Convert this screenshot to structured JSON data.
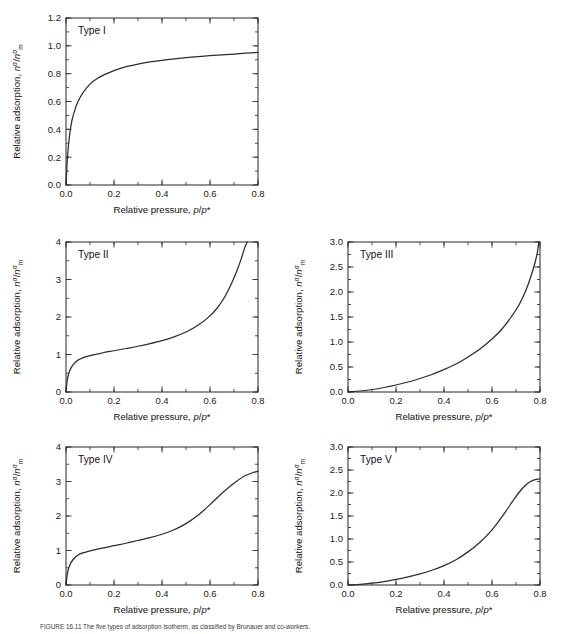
{
  "figure": {
    "caption": "FIGURE 16.11  The five types of adsorption isotherm, as classified by Brunauer and co-workers.",
    "axis": {
      "xlabel_prefix": "Relative pressure, ",
      "xlabel_var": "p/p*",
      "ylabel_prefix": "Relative adsorption, ",
      "ylabel_var": "nσ/nσm"
    }
  },
  "chart_data": [
    {
      "type": "line",
      "title": "Type I",
      "xlabel": "Relative pressure, p/p*",
      "ylabel": "Relative adsorption, nσ/nσm",
      "xlim": [
        0.0,
        0.8
      ],
      "ylim": [
        0.0,
        1.2
      ],
      "xticks": [
        0.0,
        0.2,
        0.4,
        0.6,
        0.8
      ],
      "xticklabels": [
        "0.0",
        "0.2",
        "0.4",
        "0.6",
        "0.8"
      ],
      "yticks": [
        0.0,
        0.2,
        0.4,
        0.6,
        0.8,
        1.0,
        1.2
      ],
      "yticklabels": [
        "0.0",
        "0.2",
        "0.4",
        "0.6",
        "0.8",
        "1.0",
        "1.2"
      ],
      "xminor_step": 0.1,
      "yminor_step": 0.1,
      "grid": false,
      "legend": "none",
      "x": [
        0.0,
        0.005,
        0.01,
        0.02,
        0.03,
        0.05,
        0.07,
        0.1,
        0.13,
        0.16,
        0.2,
        0.25,
        0.3,
        0.35,
        0.4,
        0.45,
        0.5,
        0.55,
        0.6,
        0.65,
        0.7,
        0.75,
        0.8
      ],
      "y": [
        0.0,
        0.17,
        0.28,
        0.42,
        0.5,
        0.6,
        0.66,
        0.725,
        0.765,
        0.793,
        0.822,
        0.85,
        0.869,
        0.884,
        0.896,
        0.906,
        0.915,
        0.922,
        0.929,
        0.935,
        0.941,
        0.947,
        0.953
      ]
    },
    {
      "type": "line",
      "title": "Type II",
      "xlabel": "Relative pressure, p/p*",
      "ylabel": "Relative adsorption, nσ/nσm",
      "xlim": [
        0.0,
        0.8
      ],
      "ylim": [
        0.0,
        4.0
      ],
      "xticks": [
        0.0,
        0.2,
        0.4,
        0.6,
        0.8
      ],
      "xticklabels": [
        "0.0",
        "0.2",
        "0.4",
        "0.6",
        "0.8"
      ],
      "yticks": [
        0,
        1,
        2,
        3,
        4
      ],
      "yticklabels": [
        "0",
        "1",
        "2",
        "3",
        "4"
      ],
      "xminor_step": 0.1,
      "yminor_step": 0.5,
      "grid": false,
      "legend": "none",
      "x": [
        0.0,
        0.005,
        0.01,
        0.02,
        0.03,
        0.05,
        0.07,
        0.1,
        0.15,
        0.2,
        0.25,
        0.3,
        0.35,
        0.4,
        0.45,
        0.5,
        0.55,
        0.6,
        0.63,
        0.66,
        0.69,
        0.71,
        0.73,
        0.745,
        0.755
      ],
      "y": [
        0.0,
        0.3,
        0.46,
        0.63,
        0.73,
        0.85,
        0.91,
        0.97,
        1.04,
        1.1,
        1.16,
        1.22,
        1.29,
        1.37,
        1.47,
        1.6,
        1.78,
        2.03,
        2.24,
        2.52,
        2.9,
        3.2,
        3.55,
        3.85,
        4.0
      ]
    },
    {
      "type": "line",
      "title": "Type III",
      "xlabel": "Relative pressure, p/p*",
      "ylabel": "Relative adsorption, nσ/nσm",
      "xlim": [
        0.0,
        0.8
      ],
      "ylim": [
        0.0,
        3.0
      ],
      "xticks": [
        0.0,
        0.2,
        0.4,
        0.6,
        0.8
      ],
      "xticklabels": [
        "0.0",
        "0.2",
        "0.4",
        "0.6",
        "0.8"
      ],
      "yticks": [
        0.0,
        0.5,
        1.0,
        1.5,
        2.0,
        2.5,
        3.0
      ],
      "yticklabels": [
        "0.0",
        "0.5",
        "1.0",
        "1.5",
        "2.0",
        "2.5",
        "3.0"
      ],
      "xminor_step": 0.1,
      "yminor_step": 0.25,
      "grid": false,
      "legend": "none",
      "x": [
        0.0,
        0.05,
        0.1,
        0.15,
        0.2,
        0.25,
        0.3,
        0.35,
        0.4,
        0.45,
        0.5,
        0.55,
        0.6,
        0.64,
        0.68,
        0.71,
        0.74,
        0.76,
        0.78,
        0.79,
        0.795
      ],
      "y": [
        0.0,
        0.02,
        0.05,
        0.09,
        0.14,
        0.2,
        0.27,
        0.35,
        0.45,
        0.56,
        0.7,
        0.86,
        1.06,
        1.25,
        1.5,
        1.72,
        2.02,
        2.28,
        2.6,
        2.82,
        3.0
      ]
    },
    {
      "type": "line",
      "title": "Type IV",
      "xlabel": "Relative pressure, p/p*",
      "ylabel": "Relative adsorption, nσ/nσm",
      "xlim": [
        0.0,
        0.8
      ],
      "ylim": [
        0.0,
        4.0
      ],
      "xticks": [
        0.0,
        0.2,
        0.4,
        0.6,
        0.8
      ],
      "xticklabels": [
        "0.0",
        "0.2",
        "0.4",
        "0.6",
        "0.8"
      ],
      "yticks": [
        0,
        1,
        2,
        3,
        4
      ],
      "yticklabels": [
        "0",
        "1",
        "2",
        "3",
        "4"
      ],
      "xminor_step": 0.1,
      "yminor_step": 0.5,
      "grid": false,
      "legend": "none",
      "x": [
        0.0,
        0.005,
        0.01,
        0.02,
        0.03,
        0.05,
        0.07,
        0.1,
        0.15,
        0.2,
        0.25,
        0.3,
        0.35,
        0.4,
        0.45,
        0.5,
        0.55,
        0.6,
        0.65,
        0.7,
        0.75,
        0.78,
        0.8
      ],
      "y": [
        0.0,
        0.3,
        0.46,
        0.64,
        0.74,
        0.87,
        0.93,
        0.99,
        1.07,
        1.14,
        1.21,
        1.29,
        1.37,
        1.47,
        1.6,
        1.78,
        2.02,
        2.33,
        2.66,
        2.95,
        3.18,
        3.26,
        3.3
      ]
    },
    {
      "type": "line",
      "title": "Type V",
      "xlabel": "Relative pressure, p/p*",
      "ylabel": "Relative adsorption, nσ/nσm",
      "xlim": [
        0.0,
        0.8
      ],
      "ylim": [
        0.0,
        3.0
      ],
      "xticks": [
        0.0,
        0.2,
        0.4,
        0.6,
        0.8
      ],
      "xticklabels": [
        "0.0",
        "0.2",
        "0.4",
        "0.6",
        "0.8"
      ],
      "yticks": [
        0.0,
        0.5,
        1.0,
        1.5,
        2.0,
        2.5,
        3.0
      ],
      "yticklabels": [
        "0.0",
        "0.5",
        "1.0",
        "1.5",
        "2.0",
        "2.5",
        "3.0"
      ],
      "xminor_step": 0.1,
      "yminor_step": 0.25,
      "grid": false,
      "legend": "none",
      "x": [
        0.0,
        0.05,
        0.1,
        0.15,
        0.2,
        0.25,
        0.3,
        0.35,
        0.4,
        0.45,
        0.5,
        0.55,
        0.6,
        0.63,
        0.66,
        0.69,
        0.72,
        0.74,
        0.76,
        0.78,
        0.8
      ],
      "y": [
        0.0,
        0.015,
        0.04,
        0.075,
        0.12,
        0.175,
        0.24,
        0.32,
        0.42,
        0.55,
        0.72,
        0.93,
        1.2,
        1.4,
        1.62,
        1.85,
        2.06,
        2.17,
        2.25,
        2.29,
        2.31
      ]
    }
  ],
  "panels": [
    {
      "label": "Type I",
      "left": 0,
      "top": 0,
      "w": 282,
      "h": 222
    },
    {
      "label": "Type II",
      "left": 0,
      "top": 224,
      "w": 282,
      "h": 205
    },
    {
      "label": "Type III",
      "left": 282,
      "top": 224,
      "w": 282,
      "h": 205
    },
    {
      "label": "Type IV",
      "left": 0,
      "top": 429,
      "w": 282,
      "h": 193
    },
    {
      "label": "Type V",
      "left": 282,
      "top": 429,
      "w": 282,
      "h": 193
    }
  ]
}
